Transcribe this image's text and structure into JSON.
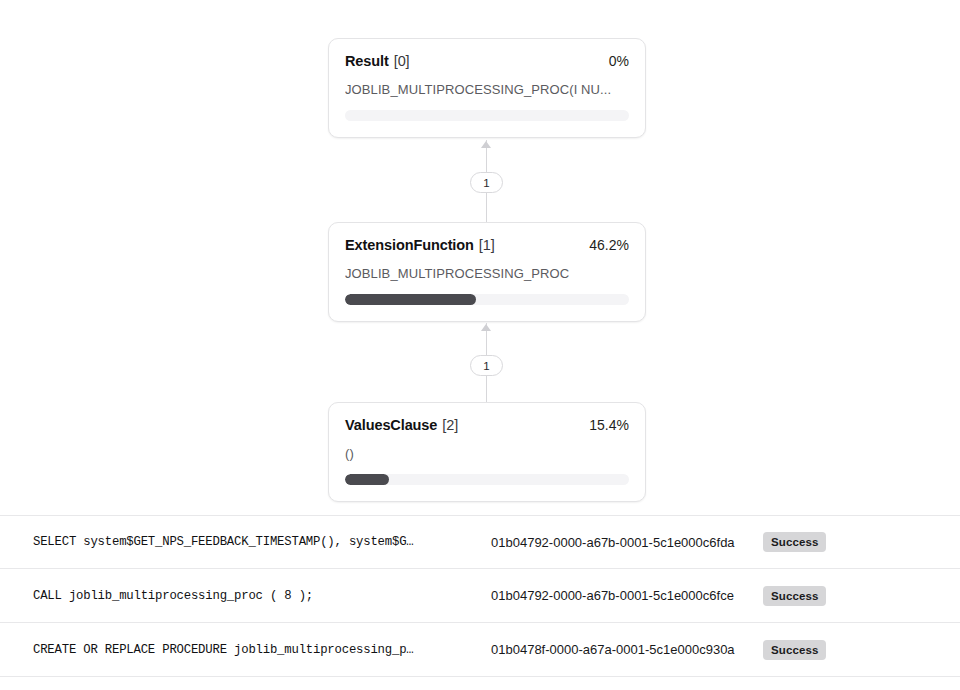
{
  "graph": {
    "nodes": [
      {
        "name": "Result",
        "index": "[0]",
        "percent_label": "0%",
        "percent_value": 0,
        "detail": "JOBLIB_MULTIPROCESSING_PROC(I NU...",
        "bar_color": "#4a4a4f",
        "track_color": "#f4f4f6"
      },
      {
        "name": "ExtensionFunction",
        "index": "[1]",
        "percent_label": "46.2%",
        "percent_value": 46.2,
        "detail": "JOBLIB_MULTIPROCESSING_PROC",
        "bar_color": "#4a4a4f",
        "track_color": "#f4f4f6"
      },
      {
        "name": "ValuesClause",
        "index": "[2]",
        "percent_label": "15.4%",
        "percent_value": 15.4,
        "detail": "()",
        "bar_color": "#4a4a4f",
        "track_color": "#f4f4f6"
      }
    ],
    "edges": [
      {
        "label": "1",
        "from": "ExtensionFunction",
        "to": "Result"
      },
      {
        "label": "1",
        "from": "ValuesClause",
        "to": "ExtensionFunction"
      }
    ]
  },
  "history": {
    "rows": [
      {
        "sql": "SELECT system$GET_NPS_FEEDBACK_TIMESTAMP(), system$G…",
        "query_id": "01b04792-0000-a67b-0001-5c1e000c6fda",
        "status": "Success"
      },
      {
        "sql": "CALL joblib_multiprocessing_proc ( 8 );",
        "query_id": "01b04792-0000-a67b-0001-5c1e000c6fce",
        "status": "Success"
      },
      {
        "sql": "CREATE OR REPLACE PROCEDURE joblib_multiprocessing_p…",
        "query_id": "01b0478f-0000-a67a-0001-5c1e000c930a",
        "status": "Success"
      }
    ]
  }
}
